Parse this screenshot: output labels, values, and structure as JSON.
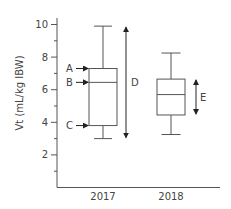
{
  "chart_data": {
    "type": "box",
    "title": "",
    "xlabel": "",
    "ylabel": "Vt (mL/kg IBW)",
    "ylim": [
      0,
      10.5
    ],
    "yticks_labeled": [
      2,
      4,
      6,
      8,
      10
    ],
    "yticks_minor": [
      1,
      3,
      5,
      7,
      9
    ],
    "grid": false,
    "categories": [
      "2017",
      "2018"
    ],
    "series": [
      {
        "name": "2017",
        "min": 3.0,
        "q1": 3.8,
        "median": 6.45,
        "q3": 7.3,
        "max": 9.9
      },
      {
        "name": "2018",
        "min": 3.25,
        "q1": 4.45,
        "median": 5.7,
        "q3": 6.65,
        "max": 8.25
      }
    ],
    "annotations": [
      {
        "label": "A",
        "points_to": "2017 Q3 (upper quartile)",
        "value": 7.3
      },
      {
        "label": "B",
        "points_to": "2017 median",
        "value": 6.45
      },
      {
        "label": "C",
        "points_to": "2017 Q1 (lower quartile)",
        "value": 3.8
      },
      {
        "label": "D",
        "spans": "2017 range (min to max)",
        "from": 3.0,
        "to": 9.9
      },
      {
        "label": "E",
        "spans": "2018 interquartile range",
        "from": 4.45,
        "to": 6.65
      }
    ]
  }
}
